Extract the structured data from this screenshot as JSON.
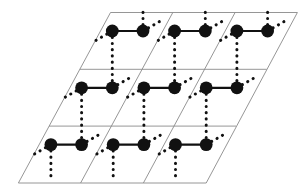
{
  "figure": {
    "name": "crystal-lattice-diagram",
    "background_color": "#ffffff"
  },
  "style": {
    "cell_line_color": "#8a8a8a",
    "cell_line_width": 0.9,
    "atom_color": "#111111",
    "atom_radius": 6.4,
    "solid_bond_color": "#111111",
    "solid_bond_width": 2.2,
    "dotted_bond_color": "#111111",
    "dotted_bond_width": 3.0,
    "dotted_bond_dash": "0.2 6.0",
    "dot_radius": 1.6
  },
  "lattice": {
    "type": "oblique",
    "rows": 3,
    "columns": 3,
    "origin_top_left": [
      110.5,
      12.5
    ],
    "a_vector": [
      62.3,
      0.0
    ],
    "b_vector": [
      -30.7,
      56.8
    ],
    "basis_atoms": 2,
    "basis_offsets": [
      [
        1.8,
        18.5
      ],
      [
        32.5,
        18.5
      ]
    ],
    "cell_count": 9
  },
  "grid_lines": {
    "outline_points": "110.5,12.5 297.4,12.5 206.2,183.0 18.4,183.0",
    "line_a_1": "79.8,69.3 266.7,69.3",
    "line_a_2": "49.1,126.1 236.0,126.1",
    "line_b_1": "172.8,12.5 80.6,183.0",
    "line_b_2": "235.1,12.5 143.4,183.0"
  },
  "atoms": [
    {
      "id": "a-r0-c0",
      "cx": 112.3,
      "cy": 31.0,
      "role": "basis-atom-b"
    },
    {
      "id": "b-r0-c0",
      "cx": 143.0,
      "cy": 31.0,
      "role": "basis-atom-a"
    },
    {
      "id": "a-r0-c1",
      "cx": 174.6,
      "cy": 31.0,
      "role": "basis-atom-b"
    },
    {
      "id": "b-r0-c1",
      "cx": 205.3,
      "cy": 31.0,
      "role": "basis-atom-a"
    },
    {
      "id": "a-r0-c2",
      "cx": 236.9,
      "cy": 31.0,
      "role": "basis-atom-b"
    },
    {
      "id": "b-r0-c2",
      "cx": 267.6,
      "cy": 31.0,
      "role": "basis-atom-a"
    },
    {
      "id": "a-r1-c0",
      "cx": 81.6,
      "cy": 87.8,
      "role": "basis-atom-b"
    },
    {
      "id": "b-r1-c0",
      "cx": 112.3,
      "cy": 87.8,
      "role": "basis-atom-a"
    },
    {
      "id": "a-r1-c1",
      "cx": 143.9,
      "cy": 87.8,
      "role": "basis-atom-b"
    },
    {
      "id": "b-r1-c1",
      "cx": 174.6,
      "cy": 87.8,
      "role": "basis-atom-a"
    },
    {
      "id": "a-r1-c2",
      "cx": 206.2,
      "cy": 87.8,
      "role": "basis-atom-b"
    },
    {
      "id": "b-r1-c2",
      "cx": 236.9,
      "cy": 87.8,
      "role": "basis-atom-a"
    },
    {
      "id": "a-r2-c0",
      "cx": 50.9,
      "cy": 144.6,
      "role": "basis-atom-b"
    },
    {
      "id": "b-r2-c0",
      "cx": 81.6,
      "cy": 144.6,
      "role": "basis-atom-a"
    },
    {
      "id": "a-r2-c1",
      "cx": 113.2,
      "cy": 144.6,
      "role": "basis-atom-b"
    },
    {
      "id": "b-r2-c1",
      "cx": 143.9,
      "cy": 144.6,
      "role": "basis-atom-a"
    },
    {
      "id": "a-r2-c2",
      "cx": 175.5,
      "cy": 144.6,
      "role": "basis-atom-b"
    },
    {
      "id": "b-r2-c2",
      "cx": 206.2,
      "cy": 144.6,
      "role": "basis-atom-a"
    }
  ],
  "solid_bonds": [
    {
      "x1": 112.3,
      "y1": 31.0,
      "x2": 143.0,
      "y2": 31.0
    },
    {
      "x1": 174.6,
      "y1": 31.0,
      "x2": 205.3,
      "y2": 31.0
    },
    {
      "x1": 236.9,
      "y1": 31.0,
      "x2": 267.6,
      "y2": 31.0
    },
    {
      "x1": 81.6,
      "y1": 87.8,
      "x2": 112.3,
      "y2": 87.8
    },
    {
      "x1": 143.9,
      "y1": 87.8,
      "x2": 174.6,
      "y2": 87.8
    },
    {
      "x1": 206.2,
      "y1": 87.8,
      "x2": 236.9,
      "y2": 87.8
    },
    {
      "x1": 50.9,
      "y1": 144.6,
      "x2": 81.6,
      "y2": 144.6
    },
    {
      "x1": 113.2,
      "y1": 144.6,
      "x2": 143.9,
      "y2": 144.6
    },
    {
      "x1": 175.5,
      "y1": 144.6,
      "x2": 206.2,
      "y2": 144.6
    }
  ],
  "dotted_bonds": [
    {
      "x1": 143.0,
      "y1": 31.0,
      "x2": 143.0,
      "y2": 12.0
    },
    {
      "x1": 205.3,
      "y1": 31.0,
      "x2": 205.3,
      "y2": 12.0
    },
    {
      "x1": 267.6,
      "y1": 31.0,
      "x2": 267.6,
      "y2": 12.0
    },
    {
      "x1": 143.0,
      "y1": 31.0,
      "x2": 160.5,
      "y2": 21.0
    },
    {
      "x1": 205.3,
      "y1": 31.0,
      "x2": 222.8,
      "y2": 21.0
    },
    {
      "x1": 267.6,
      "y1": 31.0,
      "x2": 285.1,
      "y2": 21.0
    },
    {
      "x1": 112.3,
      "y1": 31.0,
      "x2": 94.8,
      "y2": 41.0
    },
    {
      "x1": 174.6,
      "y1": 31.0,
      "x2": 157.1,
      "y2": 41.0
    },
    {
      "x1": 236.9,
      "y1": 31.0,
      "x2": 219.4,
      "y2": 41.0
    },
    {
      "x1": 112.3,
      "y1": 31.0,
      "x2": 112.3,
      "y2": 87.8
    },
    {
      "x1": 174.6,
      "y1": 31.0,
      "x2": 174.6,
      "y2": 87.8
    },
    {
      "x1": 236.9,
      "y1": 31.0,
      "x2": 236.9,
      "y2": 87.8
    },
    {
      "x1": 112.3,
      "y1": 87.8,
      "x2": 129.8,
      "y2": 77.8
    },
    {
      "x1": 174.6,
      "y1": 87.8,
      "x2": 192.1,
      "y2": 77.8
    },
    {
      "x1": 236.9,
      "y1": 87.8,
      "x2": 254.4,
      "y2": 77.8
    },
    {
      "x1": 81.6,
      "y1": 87.8,
      "x2": 64.1,
      "y2": 97.8
    },
    {
      "x1": 143.9,
      "y1": 87.8,
      "x2": 126.4,
      "y2": 97.8
    },
    {
      "x1": 206.2,
      "y1": 87.8,
      "x2": 188.7,
      "y2": 97.8
    },
    {
      "x1": 81.6,
      "y1": 87.8,
      "x2": 81.6,
      "y2": 144.6
    },
    {
      "x1": 143.9,
      "y1": 87.8,
      "x2": 143.9,
      "y2": 144.6
    },
    {
      "x1": 206.2,
      "y1": 87.8,
      "x2": 206.2,
      "y2": 144.6
    },
    {
      "x1": 81.6,
      "y1": 144.6,
      "x2": 99.1,
      "y2": 134.6
    },
    {
      "x1": 143.9,
      "y1": 144.6,
      "x2": 161.4,
      "y2": 134.6
    },
    {
      "x1": 206.2,
      "y1": 144.6,
      "x2": 223.7,
      "y2": 134.6
    },
    {
      "x1": 50.9,
      "y1": 144.6,
      "x2": 33.4,
      "y2": 154.6
    },
    {
      "x1": 113.2,
      "y1": 144.6,
      "x2": 95.7,
      "y2": 154.6
    },
    {
      "x1": 175.5,
      "y1": 144.6,
      "x2": 158.0,
      "y2": 154.6
    },
    {
      "x1": 50.9,
      "y1": 144.6,
      "x2": 50.9,
      "y2": 178.0
    },
    {
      "x1": 113.2,
      "y1": 144.6,
      "x2": 113.2,
      "y2": 178.0
    },
    {
      "x1": 175.5,
      "y1": 144.6,
      "x2": 175.5,
      "y2": 178.0
    }
  ]
}
